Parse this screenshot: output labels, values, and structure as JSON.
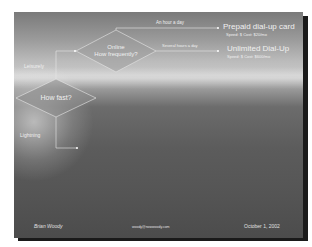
{
  "slide": {
    "colors": {
      "line": "#e8e8e8",
      "diamond_fill": "#8a8a8a",
      "text": "#f0f0f0"
    },
    "decision_main": {
      "label": "How fast?"
    },
    "decision_online": {
      "line1": "Online",
      "line2": "How frequently?"
    },
    "branches": {
      "upper": "Leisurely",
      "lower": "Lightning"
    },
    "edges": {
      "hour": "An hour a day",
      "several": "Several hours a day"
    },
    "destinations": [
      {
        "title": "Prepaid dial-up card",
        "detail": "Speed: $ Cost: $20/mo"
      },
      {
        "title": "Unlimited Dial-Up",
        "detail": "Speed: $ Cost: $600/mo"
      }
    ],
    "footer": {
      "author": "Brian Woody",
      "email": "woody@nowwoody.com",
      "date": "October 1, 2002"
    }
  }
}
